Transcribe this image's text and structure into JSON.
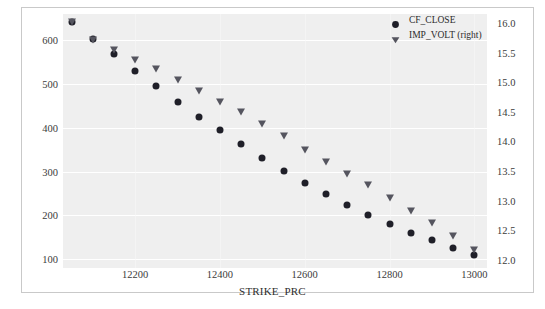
{
  "chart_data": {
    "type": "scatter",
    "title": "",
    "xlabel": "STRIKE_PRC",
    "ylabel": "",
    "ylabel_right": "",
    "grid": true,
    "legend_position": "top-right",
    "xlim": [
      12030,
      13030
    ],
    "ylim": [
      80,
      660
    ],
    "ylim_right": [
      11.86,
      16.15
    ],
    "xticks": [
      12200,
      12400,
      12600,
      12800,
      13000
    ],
    "xtick_labels": [
      "12200",
      "12400",
      "12600",
      "12800",
      "13000"
    ],
    "yticks_left": [
      100,
      200,
      300,
      400,
      500,
      600
    ],
    "ytick_labels_left": [
      "100",
      "200",
      "300",
      "400",
      "500",
      "600"
    ],
    "yticks_right": [
      12.0,
      12.5,
      13.0,
      13.5,
      14.0,
      14.5,
      15.0,
      15.5,
      16.0
    ],
    "ytick_labels_right": [
      "12.0",
      "12.5",
      "13.0",
      "13.5",
      "14.0",
      "14.5",
      "15.0",
      "15.5",
      "16.0"
    ],
    "x": [
      12050,
      12100,
      12150,
      12200,
      12250,
      12300,
      12350,
      12400,
      12450,
      12500,
      12550,
      12600,
      12650,
      12700,
      12750,
      12800,
      12850,
      12900,
      12950,
      13000
    ],
    "series": [
      {
        "name": "CF_CLOSE",
        "axis": "left",
        "marker": "circle",
        "color": "#1f1f28",
        "values": [
          641,
          604,
          568,
          529,
          495,
          460,
          425,
          395,
          363,
          331,
          302,
          274,
          250,
          224,
          201,
          180,
          161,
          143,
          125,
          109
        ]
      },
      {
        "name": "IMP_VOLT (right)",
        "axis": "right",
        "marker": "triangle-down",
        "color": "#55555f",
        "values": [
          16.01,
          15.72,
          15.55,
          15.37,
          15.22,
          15.03,
          14.85,
          14.66,
          14.5,
          14.3,
          14.09,
          13.86,
          13.65,
          13.45,
          13.26,
          13.05,
          12.83,
          12.62,
          12.4,
          12.17
        ]
      }
    ],
    "legend": [
      {
        "label": "CF_CLOSE",
        "marker": "circle",
        "color": "#1f1f28"
      },
      {
        "label": "IMP_VOLT (right)",
        "marker": "triangle-down",
        "color": "#55555f"
      }
    ]
  },
  "style": {
    "panel_color": "#efefef",
    "grid_color": "#ffffff",
    "frame_color": "#c9c9c9",
    "text_color": "#3b3b3b",
    "background": "#ffffff"
  }
}
